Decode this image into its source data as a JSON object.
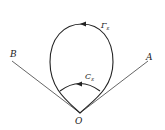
{
  "diagram": {
    "labels": {
      "B": "B",
      "A": "A",
      "O": "O",
      "gamma": "Γ",
      "gamma_sub": "ε",
      "c": "C",
      "c_sub": "ε"
    },
    "colors": {
      "stroke": "#222222",
      "rays": "#555555"
    }
  }
}
